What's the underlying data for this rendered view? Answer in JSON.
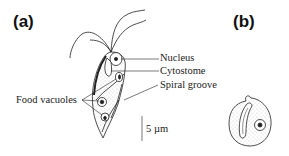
{
  "panels": {
    "a": {
      "label": "(a)"
    },
    "b": {
      "label": "(b)"
    }
  },
  "labels": {
    "nucleus": "Nucleus",
    "cytostome": "Cytostome",
    "spiral_groove": "Spiral groove",
    "food_vacuoles": "Food vacuoles",
    "scale_bar": "5 µm"
  },
  "colors": {
    "ink": "#222222",
    "stipple": "#bbbbbb",
    "background": "#ffffff"
  }
}
